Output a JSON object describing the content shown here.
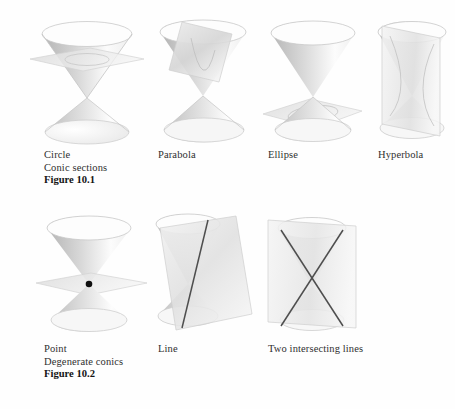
{
  "figure_1": {
    "id": "Figure 10.1",
    "group_label": "Conic sections",
    "panels": [
      {
        "label": "Circle",
        "cut": "horizontal plane cutting one nappe"
      },
      {
        "label": "Parabola",
        "cut": "plane parallel to a slant line"
      },
      {
        "label": "Ellipse",
        "cut": "oblique plane cutting one nappe"
      },
      {
        "label": "Hyperbola",
        "cut": "vertical plane cutting both nappes"
      }
    ]
  },
  "figure_2": {
    "id": "Figure 10.2",
    "group_label": "Degenerate conics",
    "panels": [
      {
        "label": "Point",
        "cut": "horizontal plane through the vertex"
      },
      {
        "label": "Line",
        "cut": "plane tangent along one generator"
      },
      {
        "label": "Two intersecting lines",
        "cut": "vertical plane through the vertex"
      }
    ]
  },
  "colors": {
    "background": "#fefefe",
    "cone_dark": "#b9b9b9",
    "cone_mid": "#d8d8d8",
    "cone_light": "#ffffff",
    "plane_fill": "#e2e2e2",
    "edge": "#bdbdbd",
    "cut_line": "#4b4b4b",
    "point_dot": "#101010",
    "text": "#2f2f2f",
    "text_bold": "#141414"
  }
}
